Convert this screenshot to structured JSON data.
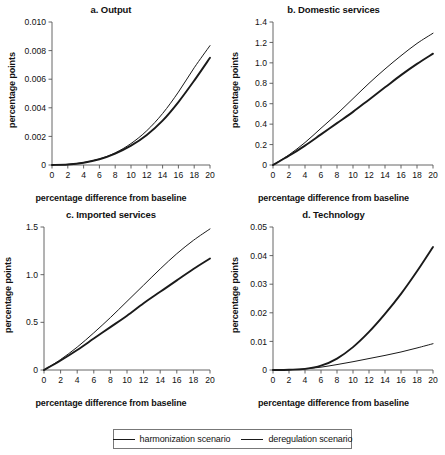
{
  "figure": {
    "width": 445,
    "height": 455,
    "background": "#ffffff",
    "line_color": "#1a1a1a",
    "axis_color": "#555555"
  },
  "legend": {
    "position": "bottom-center",
    "items": [
      {
        "label": "harmonization scenario",
        "line_width": 1.0,
        "key": "harmonization"
      },
      {
        "label": "deregulation scenario",
        "line_width": 1.9,
        "key": "deregulation"
      }
    ]
  },
  "chart_data": [
    {
      "id": "a",
      "type": "line",
      "title": "a. Output",
      "xlabel": "percentage difference from baseline",
      "ylabel": "percentage points",
      "xlim": [
        0,
        20
      ],
      "ylim": [
        0,
        0.01
      ],
      "xticks": [
        0,
        2,
        4,
        6,
        8,
        10,
        12,
        14,
        16,
        18,
        20
      ],
      "yticks": [
        0,
        0.002,
        0.004,
        0.006,
        0.008,
        0.01
      ],
      "ytick_labels": [
        "0",
        "0.002",
        "0.004",
        "0.006",
        "0.008",
        "0.010"
      ],
      "grid": false,
      "x": [
        0,
        2,
        4,
        6,
        8,
        10,
        12,
        14,
        16,
        18,
        20
      ],
      "series": [
        {
          "name": "harmonization scenario",
          "values": [
            0,
            4e-05,
            0.00017,
            0.00042,
            0.00085,
            0.0015,
            0.0024,
            0.0036,
            0.0051,
            0.0068,
            0.00835
          ]
        },
        {
          "name": "deregulation scenario",
          "values": [
            0,
            4e-05,
            0.00016,
            0.0004,
            0.0008,
            0.00135,
            0.0021,
            0.0031,
            0.0044,
            0.0059,
            0.0075
          ]
        }
      ]
    },
    {
      "id": "b",
      "type": "line",
      "title": "b. Domestic services",
      "xlabel": "percentage difference from baseline",
      "ylabel": "percentage points",
      "xlim": [
        0,
        20
      ],
      "ylim": [
        0,
        1.4
      ],
      "xticks": [
        0,
        2,
        4,
        6,
        8,
        10,
        12,
        14,
        16,
        18,
        20
      ],
      "yticks": [
        0,
        0.2,
        0.4,
        0.6,
        0.8,
        1.0,
        1.2,
        1.4
      ],
      "ytick_labels": [
        "0",
        "0.2",
        "0.4",
        "0.6",
        "0.8",
        "1.0",
        "1.2",
        "1.4"
      ],
      "grid": false,
      "x": [
        0,
        2,
        4,
        6,
        8,
        10,
        12,
        14,
        16,
        18,
        20
      ],
      "series": [
        {
          "name": "harmonization scenario",
          "values": [
            0,
            0.1,
            0.22,
            0.36,
            0.5,
            0.65,
            0.8,
            0.94,
            1.07,
            1.19,
            1.29
          ]
        },
        {
          "name": "deregulation scenario",
          "values": [
            0,
            0.09,
            0.19,
            0.3,
            0.41,
            0.52,
            0.64,
            0.76,
            0.88,
            0.99,
            1.09
          ]
        }
      ]
    },
    {
      "id": "c",
      "type": "line",
      "title": "c. Imported services",
      "xlabel": "percentage difference from baseline",
      "ylabel": "percentage points",
      "xlim": [
        0,
        20
      ],
      "ylim": [
        0,
        1.5
      ],
      "xticks": [
        0,
        2,
        4,
        6,
        8,
        10,
        12,
        14,
        16,
        18,
        20
      ],
      "yticks": [
        0,
        0.5,
        1.0,
        1.5
      ],
      "ytick_labels": [
        "0",
        "0.5",
        "1.0",
        "1.5"
      ],
      "grid": false,
      "x": [
        0,
        2,
        4,
        6,
        8,
        10,
        12,
        14,
        16,
        18,
        20
      ],
      "series": [
        {
          "name": "harmonization scenario",
          "values": [
            0,
            0.11,
            0.24,
            0.39,
            0.55,
            0.72,
            0.89,
            1.06,
            1.22,
            1.36,
            1.48
          ]
        },
        {
          "name": "deregulation scenario",
          "values": [
            0,
            0.1,
            0.21,
            0.33,
            0.45,
            0.57,
            0.7,
            0.82,
            0.94,
            1.06,
            1.17
          ]
        }
      ]
    },
    {
      "id": "d",
      "type": "line",
      "title": "d. Technology",
      "xlabel": "percentage difference from baseline",
      "ylabel": "percentage points",
      "xlim": [
        0,
        20
      ],
      "ylim": [
        0,
        0.05
      ],
      "xticks": [
        0,
        2,
        4,
        6,
        8,
        10,
        12,
        14,
        16,
        18,
        20
      ],
      "yticks": [
        0,
        0.01,
        0.02,
        0.03,
        0.04,
        0.05
      ],
      "ytick_labels": [
        "0",
        "0.01",
        "0.02",
        "0.03",
        "0.04",
        "0.05"
      ],
      "grid": false,
      "x": [
        0,
        2,
        4,
        6,
        8,
        10,
        12,
        14,
        16,
        18,
        20
      ],
      "series": [
        {
          "name": "harmonization scenario",
          "values": [
            0,
            0.0001,
            0.0004,
            0.001,
            0.0019,
            0.0029,
            0.004,
            0.0051,
            0.0063,
            0.0077,
            0.0092
          ]
        },
        {
          "name": "deregulation scenario",
          "values": [
            0,
            0.0001,
            0.0004,
            0.0015,
            0.004,
            0.008,
            0.0133,
            0.0196,
            0.0266,
            0.0345,
            0.043
          ]
        }
      ]
    }
  ]
}
